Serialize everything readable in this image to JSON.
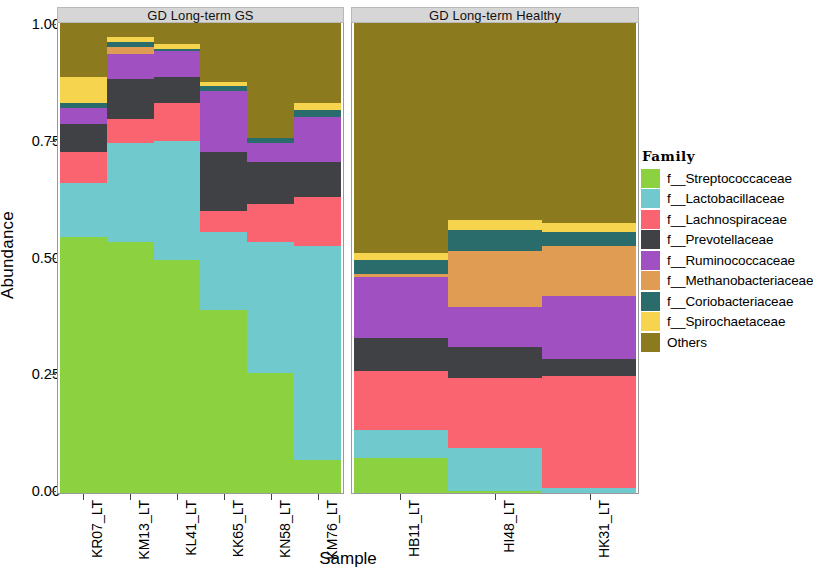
{
  "axes": {
    "ylabel": "Abundance",
    "xlabel": "Sample",
    "yticks": [
      "1.00",
      "0.75",
      "0.50",
      "0.25",
      "0.00"
    ],
    "ytick_values": [
      1.0,
      0.75,
      0.5,
      0.25,
      0.0
    ]
  },
  "legend": {
    "title": "Family",
    "items": [
      {
        "label": "f__Streptococcaceae",
        "color": "#8CD13F"
      },
      {
        "label": "f__Lactobacillaceae",
        "color": "#70C9CC"
      },
      {
        "label": "f__Lachnospiraceae",
        "color": "#FA6370"
      },
      {
        "label": "f__Prevotellaceae",
        "color": "#3F4145"
      },
      {
        "label": "f__Ruminococcaceae",
        "color": "#A150C2"
      },
      {
        "label": "f__Methanobacteriaceae",
        "color": "#E09C52"
      },
      {
        "label": "f__Coriobacteriaceae",
        "color": "#2A6B6B"
      },
      {
        "label": "f__Spirochaetaceae",
        "color": "#F6D44E"
      },
      {
        "label": "Others",
        "color": "#8B7A1E"
      }
    ]
  },
  "panels": [
    {
      "title": "GD Long-term GS",
      "samples": [
        "KR07_LT",
        "KM13_LT",
        "KL41_LT",
        "KK65_LT",
        "KN58_LT",
        "KM76_LT"
      ]
    },
    {
      "title": "GD Long-term Healthy",
      "samples": [
        "HB11_LT",
        "HI48_LT",
        "HK31_LT"
      ]
    }
  ],
  "chart_data": {
    "type": "bar",
    "stacked": true,
    "normalized": true,
    "title": "",
    "xlabel": "Sample",
    "ylabel": "Abundance",
    "ylim": [
      0,
      1
    ],
    "grid": false,
    "legend_position": "right",
    "legend_title": "Family",
    "facets": [
      "GD Long-term GS",
      "GD Long-term Healthy"
    ],
    "categories": [
      "KR07_LT",
      "KM13_LT",
      "KL41_LT",
      "KK65_LT",
      "KN58_LT",
      "KM76_LT",
      "HB11_LT",
      "HI48_LT",
      "HK31_LT"
    ],
    "series": [
      {
        "name": "f__Streptococcaceae",
        "color": "#8CD13F",
        "values": [
          0.545,
          0.535,
          0.495,
          0.39,
          0.255,
          0.07,
          0.075,
          0.005,
          0.0
        ]
      },
      {
        "name": "f__Lactobacillaceae",
        "color": "#70C9CC",
        "values": [
          0.115,
          0.21,
          0.255,
          0.165,
          0.28,
          0.455,
          0.06,
          0.09,
          0.01
        ]
      },
      {
        "name": "f__Lachnospiraceae",
        "color": "#FA6370",
        "values": [
          0.065,
          0.05,
          0.08,
          0.045,
          0.08,
          0.105,
          0.125,
          0.15,
          0.24
        ]
      },
      {
        "name": "f__Prevotellaceae",
        "color": "#3F4145",
        "values": [
          0.06,
          0.085,
          0.055,
          0.125,
          0.09,
          0.075,
          0.07,
          0.065,
          0.035
        ]
      },
      {
        "name": "f__Ruminococcaceae",
        "color": "#A150C2",
        "values": [
          0.035,
          0.055,
          0.055,
          0.13,
          0.04,
          0.095,
          0.13,
          0.085,
          0.135
        ]
      },
      {
        "name": "f__Methanobacteriaceae",
        "color": "#E09C52",
        "values": [
          0.0,
          0.015,
          0.0,
          0.0,
          0.0,
          0.0,
          0.005,
          0.12,
          0.105
        ]
      },
      {
        "name": "f__Coriobacteriaceae",
        "color": "#2A6B6B",
        "values": [
          0.01,
          0.01,
          0.005,
          0.01,
          0.01,
          0.015,
          0.03,
          0.045,
          0.03
        ]
      },
      {
        "name": "f__Spirochaetaceae",
        "color": "#F6D44E",
        "values": [
          0.055,
          0.01,
          0.01,
          0.01,
          0.0,
          0.015,
          0.015,
          0.02,
          0.02
        ]
      },
      {
        "name": "Others",
        "color": "#8B7A1E",
        "values": [
          0.115,
          0.03,
          0.045,
          0.125,
          0.245,
          0.17,
          0.49,
          0.42,
          0.425
        ]
      }
    ]
  }
}
